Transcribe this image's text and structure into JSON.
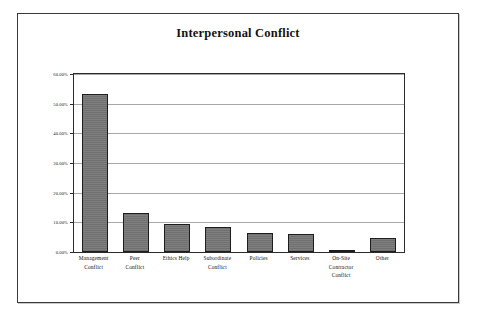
{
  "figure": {
    "title": "Interpersonal Conflict",
    "frame_color": "#3a3a3a",
    "bar_color": "#787878",
    "bar_border_color": "#1d1d1d",
    "gridline_color": "#a8a8a8",
    "axis_color": "#2b2b2b"
  },
  "chart_data": {
    "type": "bar",
    "title": "Interpersonal Conflict",
    "xlabel": "",
    "ylabel": "",
    "ylim": [
      0,
      60
    ],
    "grid": true,
    "legend": null,
    "y_tick_labels": [
      "60.00%",
      "50.00%",
      "40.00%",
      "30.00%",
      "20.00%",
      "10.00%",
      "0.00%"
    ],
    "y_tick_values": [
      60,
      50,
      40,
      30,
      20,
      10,
      0
    ],
    "categories": [
      "Management Conflict",
      "Peer Conflict",
      "Ethics Help",
      "Subordinate Conflict",
      "Policies",
      "Services",
      "On-Site Contractor Conflict",
      "Other"
    ],
    "category_lines": [
      [
        "Management",
        "Conflict"
      ],
      [
        "Peer",
        "Conflict"
      ],
      [
        "Ethics Help"
      ],
      [
        "Subordinate",
        "Conflict"
      ],
      [
        "Policies"
      ],
      [
        "Services"
      ],
      [
        "On-Site",
        "Contractor",
        "Conflict"
      ],
      [
        "Other"
      ]
    ],
    "values": [
      53.3,
      13.3,
      9.5,
      8.5,
      6.5,
      6.0,
      0.3,
      4.7
    ],
    "value_labels": [
      "53.30%",
      "13.30%",
      "9.50%",
      "8.50%",
      "6.50%",
      "6.00%",
      "0.30%",
      "4.70%"
    ]
  }
}
